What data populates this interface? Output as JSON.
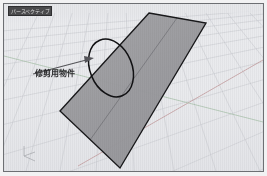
{
  "viewport": {
    "title": "パースペクティブ",
    "background_color": "#e9eaec",
    "border_color": "#6d6f73"
  },
  "annotation": {
    "label": "修剪用物件",
    "leader_color": "#4c4c50",
    "highlight_shape": "ellipse",
    "highlight_color": "#0d0d0d"
  },
  "geometry": {
    "surface_name": "trim-plane-surface",
    "fill_color": "#9b9b9f",
    "edge_color": "#141416",
    "isocurve_color": "#4a4a4e",
    "corners": [
      [
        148,
        12
      ],
      [
        205,
        22
      ],
      [
        119,
        167
      ],
      [
        59,
        110
      ]
    ]
  },
  "grid": {
    "line_color": "#c9cbd0",
    "major_line_color": "#b3b6bc",
    "x_axis_color": "#c49a9a",
    "y_axis_color": "#9ec0a4",
    "horizon_y": 10
  },
  "axis_gizmo": {
    "x_label": "x",
    "y_label": "y",
    "z_label": "z",
    "color": "#a9abb0"
  }
}
